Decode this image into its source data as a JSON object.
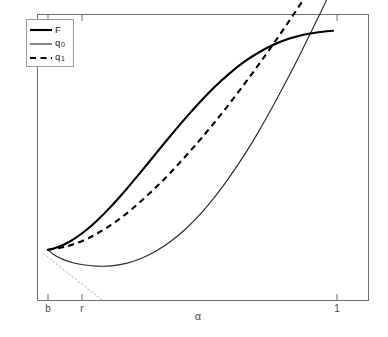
{
  "chart_data": {
    "type": "line",
    "title": "",
    "subtitle": "",
    "xlabel": "α",
    "ylabel": "",
    "grid": false,
    "legend_position": "top-left",
    "xlim": [
      0.0,
      1.12
    ],
    "ylim": [
      0.0,
      1.0
    ],
    "x_ticks": [
      {
        "value": 0.04,
        "label": "b",
        "pixel_x": 48
      },
      {
        "value": 0.14,
        "label": "r",
        "pixel_x": 82
      },
      {
        "value": 0.91,
        "label": "1",
        "pixel_x": 337
      }
    ],
    "y_ticks": [],
    "annotations": [
      {
        "name": "tangent-guide",
        "style": "dotted",
        "color": "#c9c9c9",
        "description": "faint dotted tangent line descending from the common left origin of the curves down to the x-axis just right of tick r"
      }
    ],
    "series": [
      {
        "name": "F",
        "label": "F",
        "style": "solid",
        "width": "thick",
        "color": "#000000",
        "points": [
          [
            0.035,
            0.177
          ],
          [
            0.06,
            0.184
          ],
          [
            0.09,
            0.196
          ],
          [
            0.12,
            0.213
          ],
          [
            0.16,
            0.242
          ],
          [
            0.2,
            0.278
          ],
          [
            0.25,
            0.33
          ],
          [
            0.3,
            0.388
          ],
          [
            0.35,
            0.45
          ],
          [
            0.4,
            0.513
          ],
          [
            0.45,
            0.576
          ],
          [
            0.5,
            0.637
          ],
          [
            0.55,
            0.694
          ],
          [
            0.6,
            0.747
          ],
          [
            0.65,
            0.794
          ],
          [
            0.7,
            0.835
          ],
          [
            0.75,
            0.868
          ],
          [
            0.8,
            0.895
          ],
          [
            0.85,
            0.915
          ],
          [
            0.9,
            0.929
          ],
          [
            0.95,
            0.938
          ],
          [
            1.0,
            0.943
          ]
        ]
      },
      {
        "name": "q0",
        "label": "q₀",
        "style": "solid",
        "width": "thin",
        "color": "#2a2a2a",
        "points": [
          [
            0.035,
            0.177
          ],
          [
            0.06,
            0.157
          ],
          [
            0.09,
            0.142
          ],
          [
            0.12,
            0.132
          ],
          [
            0.16,
            0.124
          ],
          [
            0.2,
            0.12
          ],
          [
            0.25,
            0.121
          ],
          [
            0.3,
            0.13
          ],
          [
            0.35,
            0.147
          ],
          [
            0.4,
            0.172
          ],
          [
            0.45,
            0.206
          ],
          [
            0.5,
            0.249
          ],
          [
            0.55,
            0.301
          ],
          [
            0.6,
            0.362
          ],
          [
            0.65,
            0.432
          ],
          [
            0.7,
            0.509
          ],
          [
            0.75,
            0.594
          ],
          [
            0.8,
            0.686
          ],
          [
            0.85,
            0.783
          ],
          [
            0.9,
            0.885
          ],
          [
            0.95,
            0.99
          ],
          [
            1.0,
            1.098
          ]
        ]
      },
      {
        "name": "q1",
        "label": "q₁",
        "style": "dashed",
        "width": "thick",
        "color": "#000000",
        "points": [
          [
            0.035,
            0.177
          ],
          [
            0.06,
            0.181
          ],
          [
            0.09,
            0.187
          ],
          [
            0.12,
            0.196
          ],
          [
            0.16,
            0.212
          ],
          [
            0.2,
            0.233
          ],
          [
            0.25,
            0.265
          ],
          [
            0.3,
            0.303
          ],
          [
            0.35,
            0.347
          ],
          [
            0.4,
            0.395
          ],
          [
            0.45,
            0.447
          ],
          [
            0.5,
            0.503
          ],
          [
            0.55,
            0.562
          ],
          [
            0.6,
            0.624
          ],
          [
            0.65,
            0.689
          ],
          [
            0.7,
            0.757
          ],
          [
            0.75,
            0.827
          ],
          [
            0.8,
            0.9
          ],
          [
            0.85,
            0.975
          ],
          [
            0.9,
            1.052
          ],
          [
            0.93,
            1.1
          ]
        ]
      }
    ]
  },
  "legend": {
    "entries": [
      {
        "label": "F",
        "sub": "",
        "style": "solid-thick"
      },
      {
        "label": "q",
        "sub": "0",
        "style": "solid-thin"
      },
      {
        "label": "q",
        "sub": "1",
        "style": "dashed-thick"
      }
    ]
  },
  "axes": {
    "x_label": "α",
    "tick_b": "b",
    "tick_r": "r",
    "tick_one": "1"
  }
}
